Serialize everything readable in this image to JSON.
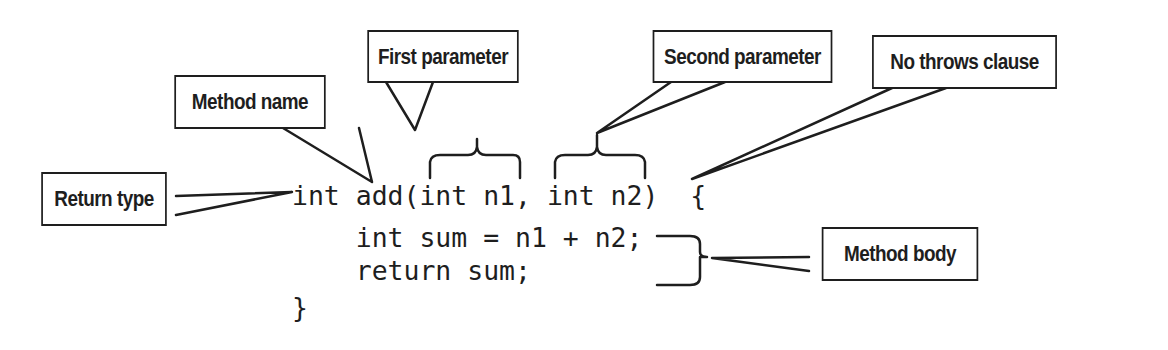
{
  "diagram": {
    "code_lines": [
      "int add(int n1, int n2)  {",
      "    int sum = n1 + n2;",
      "    return sum;",
      "}"
    ],
    "callouts": {
      "first_parameter": "First parameter",
      "method_name": "Method name",
      "second_parameter": "Second parameter",
      "no_throws_clause": "No throws clause",
      "return_type": "Return type",
      "method_body": "Method body"
    },
    "colors": {
      "ink": "#1e1e1e",
      "background": "#ffffff"
    }
  }
}
